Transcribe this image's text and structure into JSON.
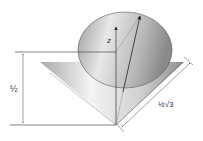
{
  "diagram": {
    "type": "cone-vector",
    "labels": {
      "axis": "z",
      "height": "½",
      "slant": "½√3"
    },
    "colors": {
      "line": "#333333",
      "cone_light": "#f2f2f2",
      "cone_dark": "#9a9a9a",
      "top_light": "#e6e6e6",
      "top_dark": "#8c8c8c"
    }
  }
}
